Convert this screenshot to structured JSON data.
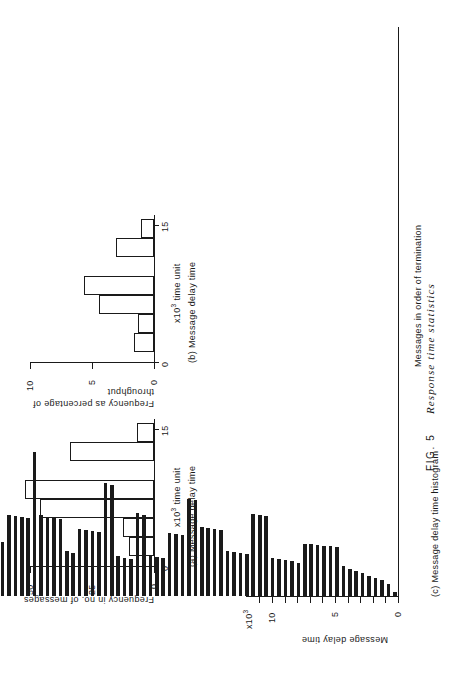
{
  "figure": {
    "number_label": "FIG. 5",
    "title": "Response time statistics",
    "caption_full": "FIG. 5  Response time statistics"
  },
  "panels": {
    "a": {
      "caption": "(a) Message delay time",
      "ylabel": "Frequency in no. of messages",
      "xlabel_unit": "x10",
      "xlabel_unit_exp": "3",
      "xlabel_unit_tail": " time unit",
      "y_ticks": [
        "0",
        "25",
        "50"
      ],
      "x_ticks": [
        "0",
        "15"
      ]
    },
    "b": {
      "caption": "(b) Message delay time",
      "ylabel_line1": "Frequency as percentage of",
      "ylabel_line2": "throughput",
      "xlabel_unit": "x10",
      "xlabel_unit_exp": "3",
      "xlabel_unit_tail": " time unit",
      "y_ticks": [
        "0",
        "5",
        "10"
      ],
      "x_ticks": [
        "0",
        "15"
      ]
    },
    "c": {
      "caption": "(c) Message delay time histogram",
      "ylabel": "Message delay time",
      "ylabel_unit": "x10",
      "ylabel_unit_exp": "3",
      "xlabel": "Messages in order of termination",
      "y_ticks": [
        "0",
        "5",
        "10"
      ]
    }
  },
  "chart_data": [
    {
      "id": "a",
      "type": "bar",
      "title": "(a) Message delay time",
      "xlabel": "Message delay time  x10^3 time unit",
      "ylabel": "Frequency in no. of messages",
      "xlim": [
        0,
        16.5
      ],
      "ylim": [
        0,
        57
      ],
      "xticks": [
        0,
        15
      ],
      "yticks": [
        0,
        25,
        50
      ],
      "grid": false,
      "bin_edges": [
        1.2,
        3.3,
        5.4,
        7.5,
        9.6,
        11.7,
        13.8,
        15.9
      ],
      "categories": [
        "1.2-3.3",
        "3.3-5.4",
        "5.4-7.5",
        "7.5-9.6",
        "9.6-11.7",
        "11.7-13.8",
        "13.8-15.9"
      ],
      "values": [
        11,
        14,
        46,
        53,
        0,
        34,
        7
      ]
    },
    {
      "id": "b",
      "type": "bar",
      "title": "(b) Message delay time",
      "xlabel": "Message delay time  x10^3 time unit",
      "ylabel": "Frequency as percentage of throughput",
      "xlim": [
        0,
        16.5
      ],
      "ylim": [
        0,
        11
      ],
      "xticks": [
        0,
        15
      ],
      "yticks": [
        0,
        5,
        10
      ],
      "grid": false,
      "bin_edges": [
        1.2,
        3.3,
        5.4,
        7.5,
        9.6,
        11.7,
        13.8,
        15.9
      ],
      "categories": [
        "1.2-3.3",
        "3.3-5.4",
        "5.4-7.5",
        "7.5-9.6",
        "9.6-11.7",
        "11.7-13.8",
        "13.8-15.9"
      ],
      "values": [
        1.6,
        1.3,
        4.4,
        5.6,
        0,
        3.1,
        1.0
      ]
    },
    {
      "id": "c",
      "type": "bar",
      "title": "(c) Message delay time histogram",
      "xlabel": "Messages in order of termination",
      "ylabel": "Message delay time  x10^3",
      "ylim": [
        0,
        12
      ],
      "yticks": [
        0,
        1,
        2,
        3,
        4,
        5,
        6,
        7,
        8,
        9,
        10,
        11
      ],
      "ylabels_shown": [
        0,
        5,
        10
      ],
      "grid": false,
      "orientation": "vertical-bars-per-message",
      "values": [
        0.3,
        0.95,
        1.25,
        1.45,
        1.6,
        1.8,
        2.0,
        2.15,
        2.35,
        3.85,
        3.95,
        4.0,
        4.05,
        4.1,
        4.15,
        2.6,
        2.75,
        2.85,
        2.95,
        3.05,
        6.35,
        6.45,
        6.5,
        3.3,
        3.4,
        3.5,
        3.6,
        5.25,
        5.35,
        5.4,
        5.45,
        7.6,
        7.7,
        4.85,
        4.95,
        5.0,
        3.0,
        3.1,
        3.2,
        6.45,
        6.55,
        2.95,
        3.05,
        3.15,
        8.8,
        8.95,
        5.05,
        5.15,
        5.25,
        5.3,
        3.45,
        3.55,
        6.1,
        6.2,
        6.3,
        6.4,
        11.4,
        6.2,
        6.3,
        6.35,
        6.45,
        4.25,
        4.35,
        8.6,
        8.7,
        5.4,
        5.5,
        5.6,
        3.8,
        3.9,
        7.45,
        7.55,
        7.6,
        7.65,
        7.7,
        7.8,
        6.1,
        6.2,
        9.6,
        6.05,
        6.15,
        6.25,
        6.35,
        6.45,
        6.55,
        6.65,
        6.75,
        7.0
      ]
    }
  ]
}
